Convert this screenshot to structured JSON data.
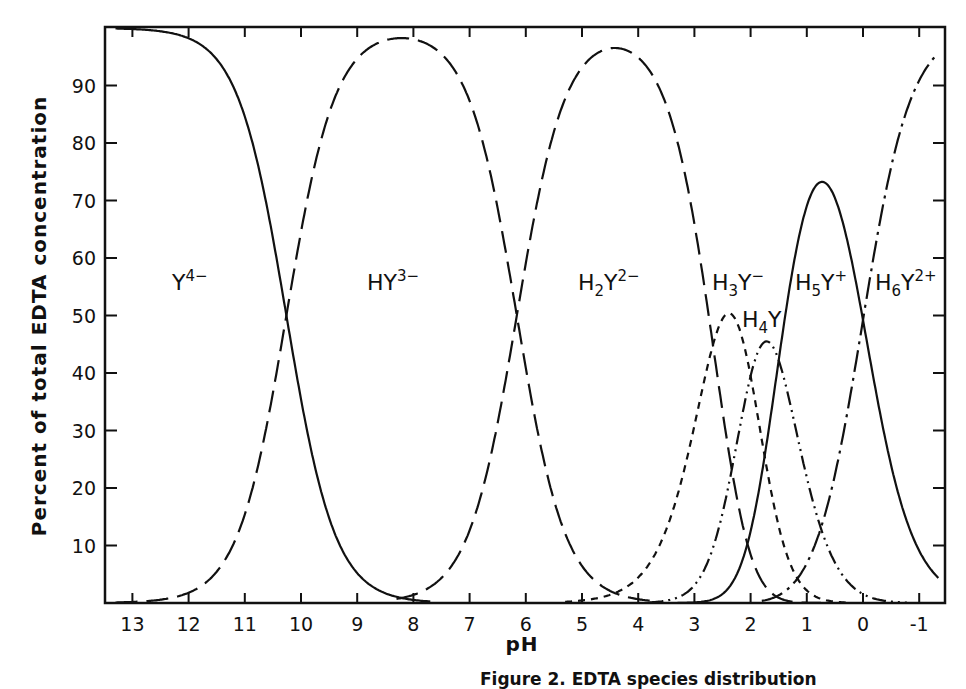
{
  "caption": "Figure 2. EDTA species distribution",
  "chart_data": {
    "type": "line",
    "title": "",
    "xlabel": "pH",
    "ylabel": "Percent of total EDTA concentration",
    "xlim": [
      13.5,
      -1.5
    ],
    "ylim": [
      0,
      100
    ],
    "x_ticks": [
      13,
      12,
      11,
      10,
      9,
      8,
      7,
      6,
      5,
      4,
      3,
      2,
      1,
      0,
      -1
    ],
    "x_tick_labels": [
      "13",
      "12",
      "11",
      "10",
      "9",
      "8",
      "7",
      "6",
      "5",
      "4",
      "3",
      "2",
      "1",
      "0",
      "-1"
    ],
    "y_ticks": [
      10,
      20,
      30,
      40,
      50,
      60,
      70,
      80,
      90
    ],
    "y_tick_labels": [
      "10",
      "20",
      "30",
      "40",
      "50",
      "60",
      "70",
      "80",
      "90"
    ],
    "grid": false,
    "legend": "inline labels",
    "pKa": [
      0.0,
      1.5,
      2.0,
      2.67,
      6.16,
      10.26
    ],
    "series": [
      {
        "name": "Y4-",
        "label_base": "Y",
        "label_sub": "",
        "label_sup": "4−",
        "style": "solid",
        "peak_pH": 13.5,
        "peak_value": 100,
        "x": [
          13,
          12,
          11,
          10.5,
          10.26,
          10,
          9.5,
          9,
          8.5,
          8
        ],
        "values": [
          99.8,
          98.3,
          85.0,
          63.7,
          50.0,
          35.5,
          15.2,
          5.3,
          1.7,
          0.5
        ]
      },
      {
        "name": "HY3-",
        "label_base": "HY",
        "label_sub": "",
        "label_sup": "3−",
        "style": "long-dash",
        "peak_pH": 8.2,
        "peak_value": 98.5,
        "x": [
          13,
          12,
          11,
          10.5,
          10.26,
          10,
          9,
          8.2,
          7,
          6.5,
          6.16,
          5.5,
          5,
          4.5,
          4
        ],
        "values": [
          0.2,
          1.7,
          15.0,
          36.3,
          50.0,
          64.4,
          93.8,
          98.5,
          87.4,
          68.4,
          50.0,
          18.0,
          6.5,
          2.1,
          0.7
        ]
      },
      {
        "name": "H2Y2-",
        "label_base": "H",
        "label_sub": "2",
        "label_sup": "2−",
        "style": "long-dash",
        "peak_pH": 4.4,
        "peak_value": 96.5,
        "x": [
          8,
          7,
          6.16,
          5.5,
          5,
          4.4,
          4,
          3.5,
          3,
          2.67,
          2.5,
          2,
          1.5,
          1
        ],
        "values": [
          1.4,
          12.6,
          50.0,
          81.9,
          91.2,
          96.5,
          94.8,
          85.6,
          66.0,
          47.3,
          38.7,
          16.0,
          5.0,
          0.9
        ]
      },
      {
        "name": "H3Y-",
        "label_base": "H",
        "label_sub": "3",
        "label_sup": "−",
        "style": "short-dash",
        "peak_pH": 2.45,
        "peak_value": 51,
        "x": [
          5,
          4,
          3.5,
          3,
          2.67,
          2.45,
          2,
          1.5,
          1,
          0.5
        ],
        "values": [
          0.4,
          4.4,
          12.8,
          31.2,
          44.3,
          51.0,
          38.0,
          17.0,
          4.8,
          0.9
        ]
      },
      {
        "name": "H4Y",
        "label_base": "H",
        "label_sub": "4",
        "label_sup": "",
        "style": "dash-dot-dot",
        "peak_pH": 1.75,
        "peak_value": 45,
        "x": [
          3.5,
          3,
          2.5,
          2,
          1.75,
          1.5,
          1,
          0.5,
          0,
          -0.5
        ],
        "values": [
          1.0,
          3.2,
          18.0,
          38.0,
          45.0,
          43.0,
          27.0,
          11.0,
          3.0,
          0.5
        ]
      },
      {
        "name": "H5Y+",
        "label_base": "H",
        "label_sub": "5",
        "label_sup": "+",
        "style": "solid",
        "peak_pH": 0.75,
        "peak_value": 73.5,
        "x": [
          3,
          2.5,
          2,
          1.5,
          1,
          0.75,
          0.5,
          0,
          -0.5,
          -1,
          -1.2
        ],
        "values": [
          0.5,
          3.0,
          14.0,
          38.0,
          65.0,
          73.5,
          70.0,
          50.0,
          24.0,
          9.0,
          6.0
        ]
      },
      {
        "name": "H6Y2+",
        "label_base": "H",
        "label_sub": "6",
        "label_sup": "2+",
        "style": "long-dash-dot",
        "peak_pH": -1.2,
        "peak_value": 97,
        "x": [
          1.5,
          1,
          0.5,
          0,
          -0.5,
          -1,
          -1.2
        ],
        "values": [
          1.0,
          5.0,
          20.0,
          50.0,
          76.0,
          91.0,
          97.0
        ]
      }
    ]
  }
}
